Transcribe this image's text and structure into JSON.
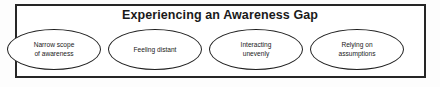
{
  "diagram": {
    "title": "Experiencing an Awareness Gap",
    "container_border_color": "#262626",
    "node_border_color": "#1f1f1f",
    "text_color": "#1a1a1a",
    "background_color": "#ffffff",
    "nodes": [
      {
        "label": "Narrow scope\nof awareness"
      },
      {
        "label": "Feeling distant"
      },
      {
        "label": "Interacting\nunevenly"
      },
      {
        "label": "Relying on\nassumptions"
      }
    ]
  }
}
